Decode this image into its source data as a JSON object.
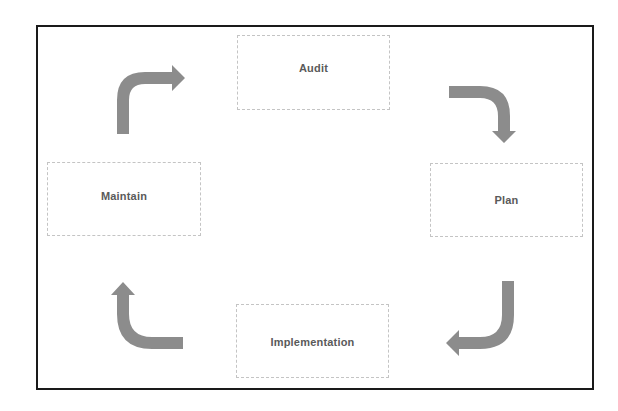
{
  "diagram": {
    "type": "cycle",
    "stages": [
      {
        "id": "audit",
        "label": "Audit"
      },
      {
        "id": "plan",
        "label": "Plan"
      },
      {
        "id": "implementation",
        "label": "Implementation"
      },
      {
        "id": "maintain",
        "label": "Maintain"
      }
    ],
    "flow": [
      {
        "from": "Audit",
        "to": "Plan"
      },
      {
        "from": "Plan",
        "to": "Implementation"
      },
      {
        "from": "Implementation",
        "to": "Maintain"
      },
      {
        "from": "Maintain",
        "to": "Audit"
      }
    ],
    "colors": {
      "arrow": "#8c8c8c",
      "box_border": "#c4c4c4",
      "label_text": "#5a5a5a",
      "frame": "#1a1a1a"
    }
  }
}
